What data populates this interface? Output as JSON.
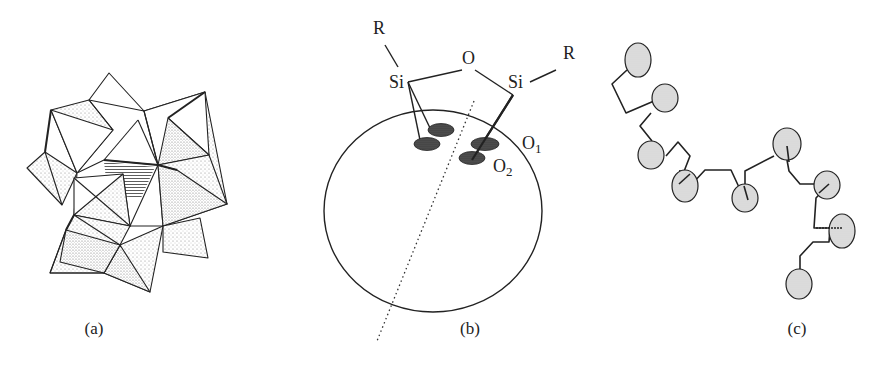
{
  "figure": {
    "panels": [
      {
        "id": "a",
        "caption": "(a)",
        "description": "Polyhedral (octahedral) cluster drawing with stippled faces and a hatched central region"
      },
      {
        "id": "b",
        "caption": "(b)",
        "description": "Siloxane (R-Si-O-Si-R) bridge bonded to surface oxygens of a spherical particle",
        "labels": {
          "r_left": "R",
          "r_right": "R",
          "o_bridge": "O",
          "si_left": "Si",
          "si_right": "Si",
          "o1": "O",
          "o1_sub": "1",
          "o2": "O",
          "o2_sub": "2"
        }
      },
      {
        "id": "c",
        "caption": "(c)",
        "description": "Chain of shaded spheres joined by zig-zag linkers"
      }
    ],
    "colors": {
      "line": "#222222",
      "stipple": "#9a9a9a",
      "sphere_fill": "#d9d9d9",
      "oxygen_fill": "#4a4a4a"
    }
  }
}
